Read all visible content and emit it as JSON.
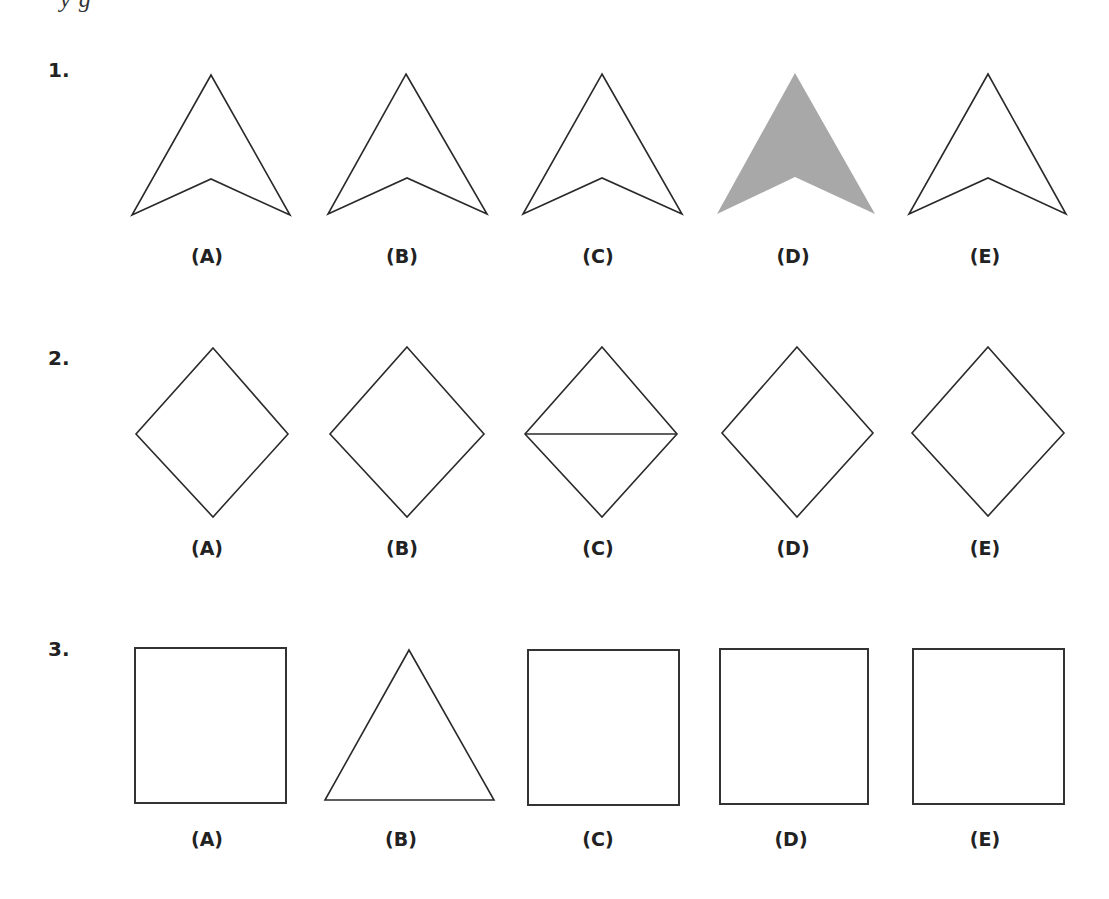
{
  "header": {
    "cutoff_text": "y      g"
  },
  "questions": [
    {
      "number": "1.",
      "options": [
        {
          "label": "(A)",
          "shape": "arrowhead",
          "fill": "none"
        },
        {
          "label": "(B)",
          "shape": "arrowhead",
          "fill": "none"
        },
        {
          "label": "(C)",
          "shape": "arrowhead",
          "fill": "none"
        },
        {
          "label": "(D)",
          "shape": "arrowhead",
          "fill": "#a8a8a8"
        },
        {
          "label": "(E)",
          "shape": "arrowhead",
          "fill": "none"
        }
      ]
    },
    {
      "number": "2.",
      "options": [
        {
          "label": "(A)",
          "shape": "diamond"
        },
        {
          "label": "(B)",
          "shape": "diamond"
        },
        {
          "label": "(C)",
          "shape": "diamond-with-horizontal-line"
        },
        {
          "label": "(D)",
          "shape": "diamond"
        },
        {
          "label": "(E)",
          "shape": "diamond"
        }
      ]
    },
    {
      "number": "3.",
      "options": [
        {
          "label": "(A)",
          "shape": "square"
        },
        {
          "label": "(B)",
          "shape": "triangle"
        },
        {
          "label": "(C)",
          "shape": "square"
        },
        {
          "label": "(D)",
          "shape": "square"
        },
        {
          "label": "(E)",
          "shape": "square"
        }
      ]
    }
  ],
  "colors": {
    "stroke": "#2a2a2a",
    "shaded_fill": "#a8a8a8",
    "background": "#ffffff"
  }
}
